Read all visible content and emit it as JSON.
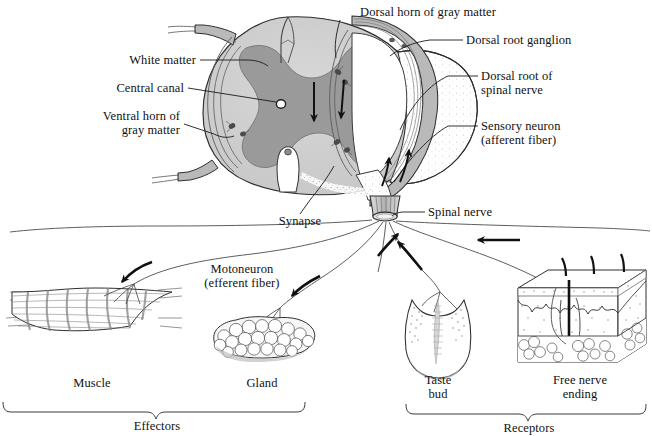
{
  "figure": {
    "background_color": "#ffffff",
    "ink_color": "#111111",
    "gray_matter_color": "#9a9a9a",
    "white_matter_color": "#cfcfcf",
    "nerve_sheath_color": "#b9b9b9",
    "stipple_color": "#bdbdbd"
  },
  "labels": {
    "dorsal_horn": "Dorsal horn of gray matter",
    "dorsal_root_ganglion": "Dorsal root ganglion",
    "dorsal_root_line1": "Dorsal root of",
    "dorsal_root_line2": "spinal nerve",
    "sensory_neuron_line1": "Sensory neuron",
    "sensory_neuron_line2": "(afferent fiber)",
    "white_matter": "White matter",
    "central_canal": "Central canal",
    "ventral_horn_line1": "Ventral horn of",
    "ventral_horn_line2": "gray matter",
    "synapse": "Synapse",
    "spinal_nerve": "Spinal nerve",
    "motoneuron_line1": "Motoneuron",
    "motoneuron_line2": "(efferent fiber)",
    "muscle": "Muscle",
    "gland": "Gland",
    "taste_bud_line1": "Taste",
    "taste_bud_line2": "bud",
    "free_nerve_line1": "Free nerve",
    "free_nerve_line2": "ending",
    "effectors": "Effectors",
    "receptors": "Receptors"
  },
  "structures": {
    "spinal_cord": "spinal cord cross section",
    "gray_matter": "butterfly shaped gray matter",
    "white_matter": "outer white matter",
    "central_canal": "central canal opening",
    "dorsal_root": "dorsal root with ganglion",
    "ventral_root": "ventral root",
    "spinal_nerve_trunk": "spinal nerve trunk",
    "muscle_organ": "skeletal muscle effector",
    "gland_organ": "gland effector",
    "taste_bud_organ": "taste bud receptor",
    "skin_block": "skin block with free nerve endings"
  },
  "arrows": {
    "count": 8,
    "direction_note": "afferent arrows point toward cord, efferent arrows point away toward effectors"
  },
  "brackets": {
    "effectors_span": "muscle and gland",
    "receptors_span": "taste bud and free nerve ending"
  }
}
